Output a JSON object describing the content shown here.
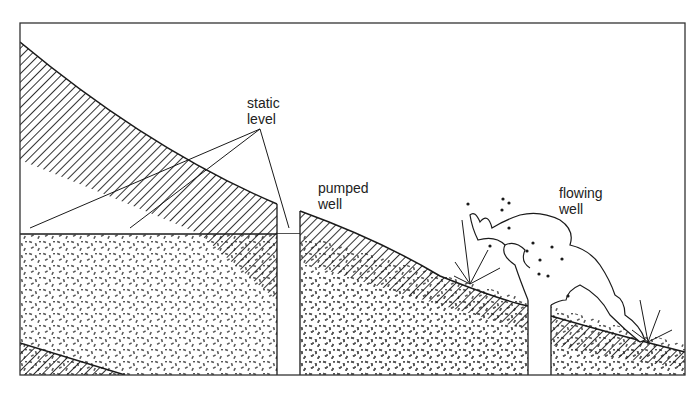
{
  "diagram": {
    "type": "cross-section",
    "labels": {
      "static_level": [
        "static",
        "level"
      ],
      "pumped_well": [
        "pumped",
        "well"
      ],
      "flowing_well": [
        "flowing",
        "well"
      ]
    },
    "layers": [
      {
        "name": "confining-layer",
        "pattern": "diagonal-hatch"
      },
      {
        "name": "aquifer",
        "pattern": "speckled-sand"
      },
      {
        "name": "lower-confining-layer",
        "pattern": "diagonal-hatch"
      }
    ],
    "colors": {
      "ink": "#1a1a1a",
      "background": "#ffffff",
      "speckle": "#555555"
    }
  }
}
